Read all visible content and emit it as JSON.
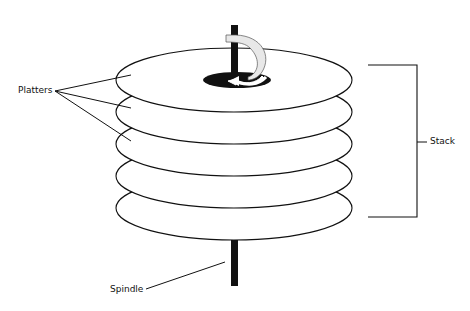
{
  "diagram": {
    "labels": {
      "platters": "Platters",
      "stack": "Stack",
      "spindle": "Spindle"
    },
    "platter_count": 5,
    "rotation_indicator": "counter-clockwise arrow around spindle",
    "colors": {
      "line": "#111111",
      "background": "#ffffff",
      "arrow_fill": "#e8e8e8"
    }
  }
}
